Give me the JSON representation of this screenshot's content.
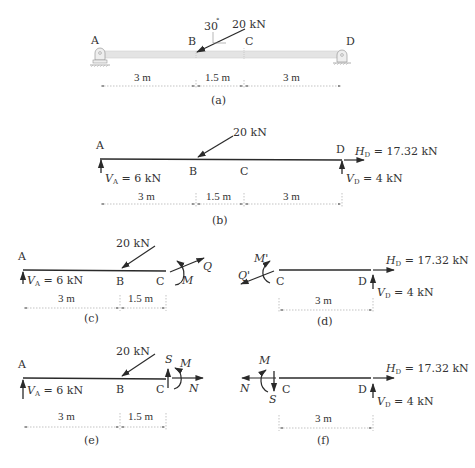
{
  "colors": {
    "ink": "#2a2a2a",
    "beam_fill": "#e4e4e4",
    "dim_line": "#9a9a9a",
    "background": "#ffffff"
  },
  "panels": {
    "a": {
      "caption": "(a)",
      "points": [
        "A",
        "B",
        "C",
        "D"
      ],
      "load": "20 kN",
      "angle": "30",
      "angle_unit": "°",
      "dims": [
        "3 m",
        "1.5 m",
        "3 m"
      ]
    },
    "b": {
      "caption": "(b)",
      "points": [
        "A",
        "B",
        "C",
        "D"
      ],
      "load": "20 kN",
      "va": {
        "sym": "V",
        "sub": "A",
        "val": " = 6 kN"
      },
      "vd": {
        "sym": "V",
        "sub": "D",
        "val": " = 4 kN"
      },
      "hd": {
        "sym": "H",
        "sub": "D",
        "val": " = 17.32 kN"
      },
      "dims": [
        "3 m",
        "1.5 m",
        "3 m"
      ]
    },
    "c": {
      "caption": "(c)",
      "points": [
        "A",
        "B",
        "C"
      ],
      "load": "20 kN",
      "va": {
        "sym": "V",
        "sub": "A",
        "val": " = 6 kN"
      },
      "moment": "M",
      "force": "Q",
      "dims": [
        "3 m",
        "1.5 m"
      ]
    },
    "d": {
      "caption": "(d)",
      "points": [
        "C",
        "D"
      ],
      "moment": "M'",
      "force": "Q'",
      "vd": {
        "sym": "V",
        "sub": "D",
        "val": " = 4 kN"
      },
      "hd": {
        "sym": "H",
        "sub": "D",
        "val": " = 17.32 kN"
      },
      "dims": [
        "3 m"
      ]
    },
    "e": {
      "caption": "(e)",
      "points": [
        "A",
        "B",
        "C"
      ],
      "load": "20 kN",
      "va": {
        "sym": "V",
        "sub": "A",
        "val": " = 6 kN"
      },
      "shear": "S",
      "moment": "M",
      "normal": "N",
      "dims": [
        "3 m",
        "1.5 m"
      ]
    },
    "f": {
      "caption": "(f)",
      "points": [
        "C",
        "D"
      ],
      "shear": "S",
      "moment": "M",
      "normal": "N",
      "vd": {
        "sym": "V",
        "sub": "D",
        "val": " = 4 kN"
      },
      "hd": {
        "sym": "H",
        "sub": "D",
        "val": " = 17.32 kN"
      },
      "dims": [
        "3 m"
      ]
    }
  }
}
